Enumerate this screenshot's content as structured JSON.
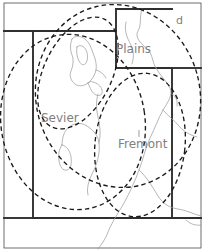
{
  "map": {
    "title": "Region map with dashed region outlines",
    "background_color": "#ffffff",
    "border_color": "#333333",
    "river_color": "#9a9a9a",
    "region_outline_color": "#1a1a1a",
    "label_color": "#808080",
    "labels": [
      {
        "id": "plains",
        "text": "Plains",
        "x": 116,
        "y": 42
      },
      {
        "id": "sevier",
        "text": "Sevier",
        "x": 41,
        "y": 111
      },
      {
        "id": "fremont",
        "text": "Fremont",
        "x": 118,
        "y": 137
      },
      {
        "id": "d",
        "text": "d",
        "x": 176,
        "y": 14
      }
    ],
    "regions": [
      {
        "id": "sevier-region",
        "label": "Sevier",
        "style": "dashed-ellipse"
      },
      {
        "id": "fremont-region",
        "label": "Fremont",
        "style": "dashed-ellipse"
      },
      {
        "id": "plains-region",
        "label": "Plains",
        "style": "dashed-ellipse"
      },
      {
        "id": "lake-region",
        "label": "",
        "style": "dashed-ellipse"
      }
    ],
    "features": [
      {
        "id": "great-salt-lake",
        "type": "lake"
      },
      {
        "id": "sevier-lake",
        "type": "lake"
      },
      {
        "id": "river-network",
        "type": "river"
      }
    ],
    "frame": {
      "width": 204,
      "height": 250
    }
  }
}
